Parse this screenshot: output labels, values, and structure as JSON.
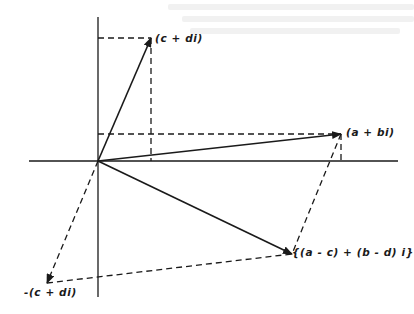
{
  "diagram": {
    "title": "",
    "type": "complex-plane vector subtraction",
    "colors": {
      "ink": "#1a1a1a",
      "background": "#ffffff",
      "bleed": "#f1f1f1"
    },
    "origin": {
      "x": 98,
      "y": 161
    },
    "axes": {
      "horizontal": {
        "x1": 29,
        "x2": 398,
        "y": 161
      },
      "vertical": {
        "x": 98,
        "y1": 17,
        "y2": 297
      }
    },
    "points": [
      {
        "id": "c_plus_di",
        "label": "(c + di)",
        "x": 151,
        "y": 38
      },
      {
        "id": "a_plus_bi",
        "label": "(a + bi)",
        "x": 341,
        "y": 134
      },
      {
        "id": "difference",
        "label": "{(a - c) + (b - d) i}",
        "x": 292,
        "y": 254
      },
      {
        "id": "neg_c_plus_di",
        "label": "-(c + di)",
        "x": 47,
        "y": 283
      }
    ],
    "solid_arrows": [
      {
        "from": "origin",
        "to": "c_plus_di"
      },
      {
        "from": "origin",
        "to": "a_plus_bi"
      },
      {
        "from": "origin",
        "to": "difference"
      }
    ],
    "dashed_arrows": [
      {
        "from": "origin",
        "to": "neg_c_plus_di"
      }
    ],
    "dashed_lines": [
      {
        "desc": "projection of c+di onto imaginary axis",
        "x1": 98,
        "y1": 38,
        "x2": 151,
        "y2": 38
      },
      {
        "desc": "projection of c+di onto real axis",
        "x1": 151,
        "y1": 38,
        "x2": 151,
        "y2": 161
      },
      {
        "desc": "projection of a+bi onto imaginary axis",
        "x1": 98,
        "y1": 134,
        "x2": 341,
        "y2": 134
      },
      {
        "desc": "projection of a+bi onto real axis",
        "x1": 341,
        "y1": 134,
        "x2": 341,
        "y2": 161
      },
      {
        "desc": "parallelogram side a+bi to difference",
        "x1": 341,
        "y1": 134,
        "x2": 292,
        "y2": 254
      },
      {
        "desc": "parallelogram side -(c+di) to difference",
        "x1": 47,
        "y1": 283,
        "x2": 292,
        "y2": 254
      }
    ]
  },
  "labels": {
    "c_plus_di": "(c + di)",
    "a_plus_bi": "(a + bi)",
    "difference": "{(a - c) + (b - d) i}",
    "neg_c_plus_di": "-(c + di)"
  }
}
